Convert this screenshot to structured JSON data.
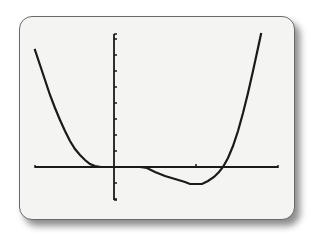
{
  "screen": {
    "frame_color": "#6a6a6a",
    "background_color": "#f4f4f2",
    "ink_color": "#1a1a1a"
  },
  "chart_data": {
    "type": "line",
    "title": "",
    "xlabel": "",
    "ylabel": "",
    "grid": false,
    "legend": null,
    "axes": {
      "x_axis_pixel": {
        "y": 167,
        "x_start": 35,
        "x_end": 278
      },
      "y_axis_pixel": {
        "x": 114,
        "y_start": 34,
        "y_end": 200
      },
      "y_tick_spacing_px": 16,
      "y_ticks_above": 8,
      "y_ticks_below": 2,
      "x_tick_marks_pixel": [
        196
      ]
    },
    "series": [
      {
        "name": "f(x)",
        "pixel_points": [
          [
            35,
            50
          ],
          [
            40,
            65
          ],
          [
            45,
            80
          ],
          [
            50,
            95
          ],
          [
            55,
            108
          ],
          [
            60,
            120
          ],
          [
            65,
            131
          ],
          [
            70,
            141
          ],
          [
            75,
            149
          ],
          [
            80,
            155
          ],
          [
            85,
            160
          ],
          [
            90,
            164
          ],
          [
            95,
            166
          ],
          [
            101,
            167
          ],
          [
            107,
            167
          ],
          [
            114,
            167
          ],
          [
            120,
            167
          ],
          [
            130,
            167
          ],
          [
            140,
            167
          ],
          [
            147,
            168
          ],
          [
            155,
            172
          ],
          [
            165,
            176
          ],
          [
            175,
            179
          ],
          [
            185,
            182
          ],
          [
            190,
            184
          ],
          [
            196,
            184
          ],
          [
            202,
            184
          ],
          [
            208,
            181
          ],
          [
            214,
            177
          ],
          [
            219,
            172
          ],
          [
            223,
            167
          ],
          [
            228,
            158
          ],
          [
            233,
            146
          ],
          [
            238,
            131
          ],
          [
            243,
            113
          ],
          [
            248,
            93
          ],
          [
            253,
            71
          ],
          [
            258,
            48
          ],
          [
            261,
            34
          ]
        ]
      }
    ],
    "key_features": {
      "touches_x_axis_near_px": 98,
      "crosses_x_axis_px": [
        145,
        223
      ],
      "local_minimum_px": [
        196,
        184
      ]
    }
  }
}
